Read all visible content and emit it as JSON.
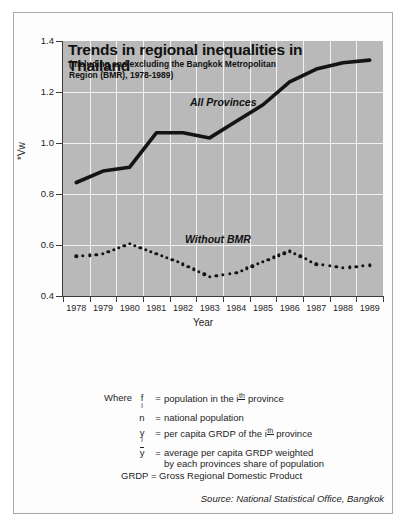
{
  "chart_data": {
    "type": "line",
    "title": "Trends in regional inequalities in Thailand",
    "subtitle": "(Including and excluding the Bangkok Metropolitan Region (BMR), 1978-1989)",
    "xlabel": "Year",
    "ylabel": "*Vw",
    "ylim": [
      0.4,
      1.4
    ],
    "ytick_labels": [
      "1.4",
      "1.2",
      "1.0",
      "0.8",
      "0.6",
      "0.4"
    ],
    "ytick_values": [
      1.4,
      1.2,
      1.0,
      0.8,
      0.6,
      0.4
    ],
    "grid": true,
    "legend_position": "inline-annotation",
    "categories": [
      "1978",
      "1979",
      "1980",
      "1981",
      "1982",
      "1983",
      "1984",
      "1985",
      "1986",
      "1987",
      "1988",
      "1989"
    ],
    "x": [
      1978,
      1979,
      1980,
      1981,
      1982,
      1983,
      1984,
      1985,
      1986,
      1987,
      1988,
      1989
    ],
    "series": [
      {
        "name": "All Provinces",
        "style": "solid",
        "color": "#141414",
        "values": [
          0.845,
          0.89,
          0.905,
          1.04,
          1.04,
          1.02,
          1.085,
          1.15,
          1.24,
          1.29,
          1.315,
          1.325
        ]
      },
      {
        "name": "Without BMR",
        "style": "dotted",
        "color": "#141414",
        "values": [
          0.555,
          0.565,
          0.605,
          0.565,
          0.525,
          0.475,
          0.49,
          0.535,
          0.575,
          0.525,
          0.51,
          0.52
        ]
      }
    ],
    "plot_background": "#b9b9b9",
    "gridline_color": "#f2f2f2"
  },
  "annotations": {
    "all_provinces_label": "All Provinces",
    "without_bmr_label": "Without BMR"
  },
  "formula": {
    "lhs": "*Vw=",
    "sum_glyph": "Σ",
    "sum_index": "i",
    "y_main": "y",
    "y_sub": "i",
    "ybar": "y",
    "exponent": "2",
    "f_main": "f",
    "f_sub": "i",
    "n": "n",
    "denominator": "y",
    "open_paren": "(",
    "minus": "–",
    "close_paren": ")"
  },
  "definitions": {
    "where_label": "Where",
    "rows": [
      {
        "symbol_main": "f",
        "symbol_sub": "i",
        "equals": "=",
        "text_before": "population in the i",
        "sup": "th",
        "text_after": "province"
      },
      {
        "symbol_main": "n",
        "symbol_sub": "",
        "equals": "=",
        "text_before": "national population",
        "sup": "",
        "text_after": ""
      },
      {
        "symbol_main": "y",
        "symbol_sub": "i",
        "equals": "=",
        "text_before": "per capita GRDP of the i",
        "sup": "th",
        "text_after": "province"
      },
      {
        "symbol_main": "y",
        "symbol_sub": "",
        "equals": "=",
        "text_before": "average per capita GRDP weighted",
        "sup": "",
        "text_after": "",
        "text_line2": "by each provinces share of population"
      }
    ]
  },
  "notes": {
    "grdp": "GRDP = Gross Regional Domestic Product",
    "source": "Source: National Statistical Office, Bangkok"
  }
}
